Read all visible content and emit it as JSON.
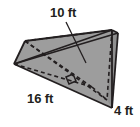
{
  "figure": {
    "name": "triangular-prism",
    "shape_label": "triangular prism",
    "fill_color": "#9d9d9d",
    "edge_color": "#231f20",
    "hidden_edge_style": "dashed",
    "background_color": "#ffffff",
    "right_angle_marker": true
  },
  "labels": {
    "slant": "10 ft",
    "base": "16 ft",
    "depth": "4 ft"
  },
  "measurements": [
    {
      "id": "slant",
      "value": 10,
      "unit": "ft",
      "text": "10 ft",
      "has_leader_line": true
    },
    {
      "id": "base",
      "value": 16,
      "unit": "ft",
      "text": "16 ft",
      "has_leader_line": false
    },
    {
      "id": "depth",
      "value": 4,
      "unit": "ft",
      "text": "4 ft",
      "has_leader_line": false
    }
  ]
}
